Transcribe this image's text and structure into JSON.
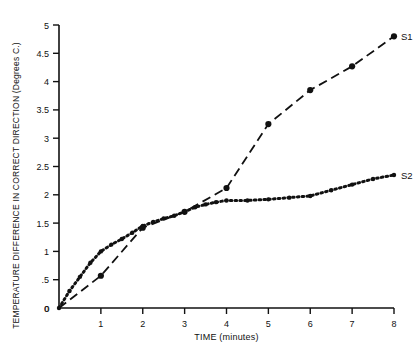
{
  "chart_data": {
    "type": "line",
    "title": "",
    "xlabel": "TIME (minutes)",
    "ylabel": "TEMPERATURE DIFFERENCE IN CORRECT DIRECTION (Degrees C.)",
    "xlim": [
      0,
      8
    ],
    "ylim": [
      0,
      5
    ],
    "xticks": [
      "0",
      "1",
      "2",
      "3",
      "4",
      "5",
      "6",
      "7",
      "8"
    ],
    "xtick_values": [
      0,
      1,
      2,
      3,
      4,
      5,
      6,
      7,
      8
    ],
    "yticks": [
      "0",
      ".5",
      "1",
      "1.5",
      "2",
      "2.5",
      "3",
      "3.5",
      "4",
      "4.5",
      "5"
    ],
    "ytick_values": [
      0,
      0.5,
      1,
      1.5,
      2,
      2.5,
      3,
      3.5,
      4,
      4.5,
      5
    ],
    "grid": false,
    "legend": "inline-right-end-labels",
    "series": [
      {
        "name": "S1",
        "label": "S1",
        "style": "dashed",
        "marker": "filled-circle",
        "x": [
          0,
          1,
          2,
          3,
          4,
          5,
          6,
          7,
          8
        ],
        "values": [
          0.0,
          0.57,
          1.42,
          1.7,
          2.12,
          3.25,
          3.85,
          4.27,
          4.8
        ]
      },
      {
        "name": "S2",
        "label": "S2",
        "style": "dotted",
        "marker": "filled-circle",
        "x": [
          0,
          0.25,
          0.5,
          0.75,
          1,
          1.25,
          1.5,
          1.75,
          2,
          2.25,
          2.5,
          2.75,
          3,
          3.25,
          3.5,
          3.75,
          4,
          4.5,
          5,
          5.5,
          6,
          6.5,
          7,
          7.5,
          8
        ],
        "values": [
          0.0,
          0.3,
          0.55,
          0.8,
          1.0,
          1.12,
          1.22,
          1.33,
          1.45,
          1.52,
          1.58,
          1.63,
          1.7,
          1.78,
          1.83,
          1.87,
          1.9,
          1.9,
          1.92,
          1.95,
          1.98,
          2.08,
          2.18,
          2.28,
          2.35
        ]
      }
    ]
  },
  "axis": {
    "x_title": "TIME (minutes)",
    "y_title": "TEMPERATURE DIFFERENCE IN CORRECT DIRECTION (Degrees C.)"
  },
  "labels": {
    "s1": "S1",
    "s2": "S2"
  },
  "colors": {
    "ink": "#111111",
    "background": "#ffffff"
  }
}
